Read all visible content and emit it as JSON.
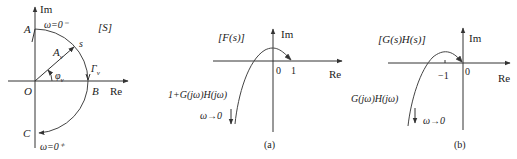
{
  "diagrams": [
    {
      "id": "s-plane",
      "plane_label": "[S]",
      "axis_x_label": "Re",
      "axis_y_label": "Im",
      "points": {
        "A": "A",
        "B": "B",
        "C": "C",
        "O": "O"
      },
      "top_omega_label": "ω=0⁻",
      "bottom_omega_label": "ω=0⁺",
      "vector_label": "A",
      "vector_sub": "ν",
      "angle_label": "φ",
      "angle_sub": "ν",
      "contour_label": "Γ",
      "contour_sub": "ν",
      "point_s_label": "s"
    },
    {
      "id": "a",
      "plane_label": "[F(s)]",
      "axis_x_label": "Re",
      "axis_y_label": "Im",
      "tick_labels": [
        "0",
        "1"
      ],
      "curve_label": "1+G(jω)H(jω)",
      "omega_label": "ω→0",
      "caption": "(a)"
    },
    {
      "id": "b",
      "plane_label": "[G(s)H(s)]",
      "axis_x_label": "Re",
      "axis_y_label": "Im",
      "tick_labels": [
        "−1",
        "0"
      ],
      "curve_label": "G(jω)H(jω)",
      "omega_label": "ω→0",
      "caption": "(b)"
    }
  ]
}
